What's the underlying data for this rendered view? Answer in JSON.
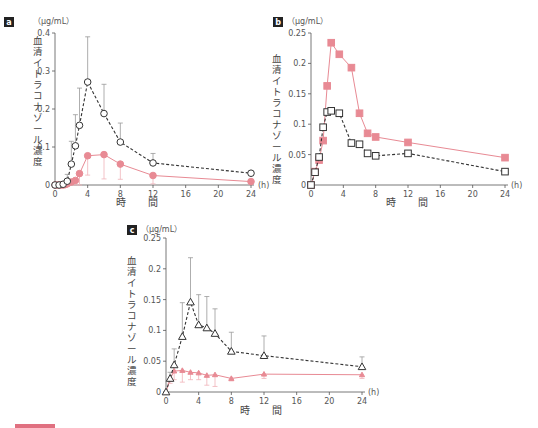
{
  "colors": {
    "reference_series": "#333333",
    "test_series": "#e88a94",
    "error_bar": "#999999",
    "axis": "#555555"
  },
  "common": {
    "y_axis_label": "血清イトラコナゾール濃度",
    "x_axis_label": "時間",
    "x_unit": "(h)",
    "y_unit": "（μg/mL）"
  },
  "chart_data": [
    {
      "panel": "a",
      "type": "line",
      "title": "",
      "xlabel": "時間",
      "ylabel": "血清イトラコナゾール濃度 (μg/mL)",
      "x_ticks": [
        0,
        4,
        8,
        12,
        16,
        20,
        24
      ],
      "y_ticks": [
        0,
        0.1,
        0.2,
        0.3,
        0.4
      ],
      "xlim": [
        0,
        24
      ],
      "ylim": [
        0,
        0.4
      ],
      "grid": false,
      "series": [
        {
          "name": "reference (open circle, dashed)",
          "marker": "circle-open",
          "line": "dashed",
          "x": [
            0,
            0.5,
            1,
            1.5,
            2,
            2.5,
            3,
            4,
            6,
            8,
            12,
            24
          ],
          "y": [
            0,
            0,
            0.002,
            0.01,
            0.055,
            0.103,
            0.157,
            0.271,
            0.188,
            0.113,
            0.058,
            0.031
          ],
          "error_upper": [
            0,
            0,
            0,
            0.028,
            0.115,
            0.185,
            0.255,
            0.39,
            0.265,
            0.163,
            0.083,
            0.031
          ]
        },
        {
          "name": "test (filled circle, solid)",
          "marker": "circle-filled",
          "line": "solid",
          "x": [
            0,
            0.25,
            0.5,
            0.75,
            1,
            1.25,
            1.5,
            2,
            2.5,
            3,
            4,
            6,
            8,
            12,
            24
          ],
          "y": [
            0,
            0,
            0,
            0,
            0,
            0.001,
            0.003,
            0.008,
            0.012,
            0.03,
            0.077,
            0.08,
            0.055,
            0.025,
            0.009
          ],
          "error_lower": [
            0,
            0,
            0,
            0,
            0,
            0,
            0,
            0,
            0,
            0,
            0.026,
            0.016,
            0.015,
            0.003,
            0.009
          ]
        }
      ]
    },
    {
      "panel": "b",
      "type": "line",
      "title": "",
      "xlabel": "時間",
      "ylabel": "血清イトラコナゾール濃度 (μg/mL)",
      "x_ticks": [
        0,
        4,
        8,
        12,
        16,
        20,
        24
      ],
      "y_ticks": [
        0,
        0.05,
        0.1,
        0.15,
        0.2,
        0.25
      ],
      "xlim": [
        0,
        24
      ],
      "ylim": [
        0,
        0.25
      ],
      "grid": false,
      "series": [
        {
          "name": "reference (open square, dashed)",
          "marker": "square-open",
          "line": "dashed",
          "x": [
            0,
            0.5,
            1,
            1.5,
            2,
            2.5,
            3.5,
            5,
            6,
            7,
            8,
            12,
            24
          ],
          "y": [
            0,
            0.021,
            0.046,
            0.095,
            0.12,
            0.122,
            0.118,
            0.069,
            0.067,
            0.052,
            0.048,
            0.052,
            0.022
          ]
        },
        {
          "name": "test (filled square, solid)",
          "marker": "square-filled",
          "line": "solid",
          "x": [
            0,
            0.5,
            1,
            1.5,
            2,
            2.5,
            3.5,
            5,
            6,
            7,
            8,
            12,
            24
          ],
          "y": [
            0,
            0.022,
            0.041,
            0.073,
            0.163,
            0.234,
            0.215,
            0.193,
            0.118,
            0.085,
            0.079,
            0.07,
            0.045
          ]
        }
      ]
    },
    {
      "panel": "c",
      "type": "line",
      "title": "",
      "xlabel": "時間",
      "ylabel": "血清イトラコナゾール濃度 (μg/mL)",
      "x_ticks": [
        0,
        4,
        8,
        12,
        16,
        20,
        24
      ],
      "y_ticks": [
        0,
        0.05,
        0.1,
        0.15,
        0.2,
        0.25
      ],
      "xlim": [
        0,
        24
      ],
      "ylim": [
        0,
        0.25
      ],
      "grid": false,
      "series": [
        {
          "name": "reference (open triangle, dashed)",
          "marker": "triangle-open",
          "line": "dashed",
          "x": [
            0,
            0.5,
            1,
            2,
            3,
            4,
            5,
            6,
            8,
            12,
            24
          ],
          "y": [
            0,
            0.022,
            0.044,
            0.09,
            0.146,
            0.109,
            0.104,
            0.095,
            0.066,
            0.059,
            0.041
          ],
          "error_upper": [
            0,
            0.032,
            0.07,
            0.145,
            0.218,
            0.158,
            0.155,
            0.135,
            0.097,
            0.091,
            0.057
          ]
        },
        {
          "name": "test (filled triangle, solid)",
          "marker": "triangle-filled",
          "line": "solid",
          "x": [
            0,
            0.5,
            1,
            2,
            3,
            4,
            5,
            6,
            8,
            12,
            24
          ],
          "y": [
            0,
            0.021,
            0.034,
            0.035,
            0.032,
            0.031,
            0.027,
            0.028,
            0.022,
            0.029,
            0.028
          ],
          "error_lower": [
            0,
            0.014,
            0.02,
            0.016,
            0.02,
            0.02,
            0.011,
            0.009,
            0.018,
            0.022,
            0.022
          ]
        }
      ]
    }
  ],
  "panels": {
    "a": {
      "badge": "a",
      "unit": "（μg/mL）",
      "x_unit": "(h)",
      "xlabel": "時　間"
    },
    "b": {
      "badge": "b",
      "unit": "（μg/mL）",
      "x_unit": "(h)",
      "xlabel": "時　間"
    },
    "c": {
      "badge": "c",
      "unit": "（μg/mL）",
      "x_unit": "(h)",
      "xlabel": "時　間"
    }
  }
}
